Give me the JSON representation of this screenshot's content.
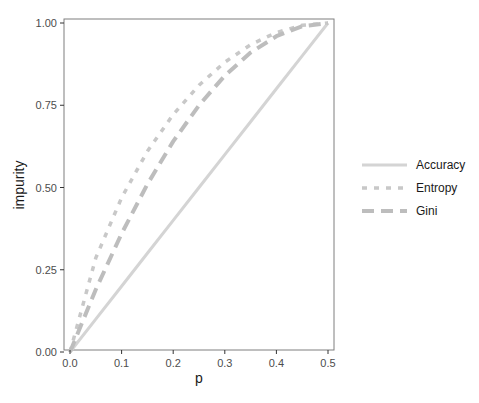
{
  "chart_data": {
    "type": "line",
    "title": "",
    "xlabel": "p",
    "ylabel": "impurity",
    "xlim": [
      0,
      0.5
    ],
    "ylim": [
      0,
      1
    ],
    "x_ticks": [
      "0.0",
      "0.1",
      "0.2",
      "0.3",
      "0.4",
      "0.5"
    ],
    "y_ticks": [
      "0.00",
      "0.25",
      "0.50",
      "0.75",
      "1.00"
    ],
    "grid": false,
    "legend_position": "right",
    "x": [
      0.0,
      0.05,
      0.1,
      0.15,
      0.2,
      0.25,
      0.3,
      0.35,
      0.4,
      0.45,
      0.5
    ],
    "series": [
      {
        "name": "Accuracy",
        "style": "solid",
        "color": "#d4d4d4",
        "values": [
          0.0,
          0.1,
          0.2,
          0.3,
          0.4,
          0.5,
          0.6,
          0.7,
          0.8,
          0.9,
          1.0
        ]
      },
      {
        "name": "Entropy",
        "style": "dotted",
        "color": "#c8c8c8",
        "values": [
          0.0,
          0.286,
          0.469,
          0.61,
          0.722,
          0.811,
          0.881,
          0.934,
          0.971,
          0.993,
          1.0
        ]
      },
      {
        "name": "Gini",
        "style": "dashed",
        "color": "#bdbdbd",
        "values": [
          0.0,
          0.19,
          0.36,
          0.51,
          0.64,
          0.75,
          0.84,
          0.91,
          0.96,
          0.99,
          1.0
        ]
      }
    ]
  },
  "legend": {
    "items": [
      {
        "label": "Accuracy"
      },
      {
        "label": "Entropy"
      },
      {
        "label": "Gini"
      }
    ]
  }
}
